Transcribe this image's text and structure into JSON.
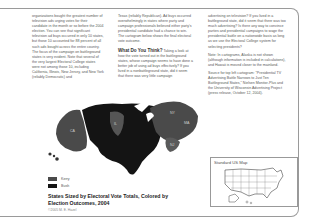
{
  "columns": {
    "col1": {
      "text": "organizations bought the greatest number of television ads urging votes for their candidate in the month or so before the 2004 election. You can see that significant television ad buys occurred in only 10 states, but those 10 accounted for 88 percent of all such ads bought across the entire country. The focus of the campaign on battleground states is very evident. Note that several of the very largest Electoral College states were not among those 10, including California, Illinois, New Jersey, and New York (reliably Democratic) and"
    },
    "col2": {
      "text": "Texas (reliably Republican). Ad buys occurred overwhelmingly in states where party and campaign professionals believed either party's presidential candidate had a chance to win. The cartogram below shows the final electoral vote outcome.",
      "heading": "What Do You Think?",
      "heading_text": "Taking a look at how the vote turned out in the battleground states, whose campaign seems to have done a better job of using ad buys effectively? If you lived in a nonbattleground state, did it seem that there was very little campaign"
    },
    "col3": {
      "para1": "advertising on television? If you lived in a battleground state, did it seem that there was too much advertising? Is there any way to convince parties and presidential campaigns to wage the presidential battle on a nationwide basis as long as we use the Electoral College system for selecting presidents?",
      "para2": "Note: In cartograms, Alaska is not shown (although information is included in calculations), and Hawaii is moved closer to the mainland.",
      "para3": "Source for top left cartogram: \"Presidential TV Advertising Battle Narrows to Just Ten Battleground States,\" Nielsen Monitor-Plus and the University of Wisconsin Advertising Project (press release, October 12, 2004)."
    }
  },
  "map": {
    "state_labels": [
      "CA",
      "IL",
      "NY",
      "MA",
      "NJ"
    ],
    "colors": {
      "kerry": "#4a4a4a",
      "bush": "#141414"
    }
  },
  "legend": {
    "items": [
      {
        "label": "Kerry",
        "color": "#4a4a4a"
      },
      {
        "label": "Bush",
        "color": "#141414"
      }
    ]
  },
  "caption": {
    "title": "States Sized by Electoral Vote Totals, Colored by Election Outcomes, 2004",
    "credit": "©2005 M. E. Hazel"
  },
  "inset": {
    "title": "Standard US Map"
  }
}
